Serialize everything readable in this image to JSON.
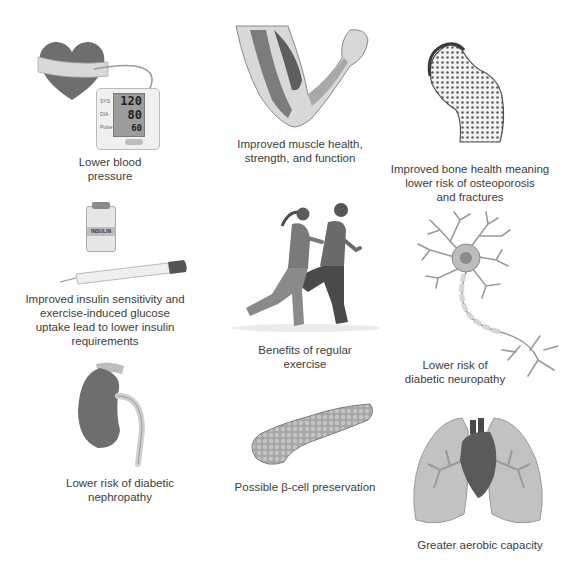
{
  "title": "Benefits of regular exercise",
  "center": {
    "label": "Benefits of regular\nexercise",
    "line1": "Benefits of regular",
    "line2": "exercise"
  },
  "benefits": [
    {
      "id": "blood-pressure",
      "line1": "Lower blood",
      "line2": "pressure",
      "line3": "",
      "line4": "",
      "monitor": {
        "sys_label": "SYS",
        "dia_label": "DIA",
        "pulse_label": "Pulse",
        "sys": "120",
        "dia": "80",
        "pulse": "60"
      }
    },
    {
      "id": "muscle",
      "line1": "Improved muscle health,",
      "line2": "strength, and function",
      "line3": "",
      "line4": ""
    },
    {
      "id": "bone",
      "line1": "Improved bone health meaning",
      "line2": "lower risk of osteoporosis",
      "line3": "and fractures",
      "line4": ""
    },
    {
      "id": "insulin",
      "line1": "Improved insulin sensitivity and",
      "line2": "exercise-induced glucose",
      "line3": "uptake lead to lower insulin",
      "line4": "requirements",
      "vial_label": "INSULIN"
    },
    {
      "id": "neuropathy",
      "line1": "Lower risk of",
      "line2": "diabetic neuropathy",
      "line3": "",
      "line4": ""
    },
    {
      "id": "nephropathy",
      "line1": "Lower risk of diabetic",
      "line2": "nephropathy",
      "line3": "",
      "line4": ""
    },
    {
      "id": "beta-cell",
      "line1": "Possible β-cell preservation",
      "line2": "",
      "line3": "",
      "line4": ""
    },
    {
      "id": "aerobic",
      "line1": "Greater aerobic capacity",
      "line2": "",
      "line3": "",
      "line4": ""
    }
  ],
  "colors": {
    "dark": "#5a5a5a",
    "mid": "#8c8c8c",
    "light": "#c8c8c8",
    "text": "#3c3c3c"
  }
}
